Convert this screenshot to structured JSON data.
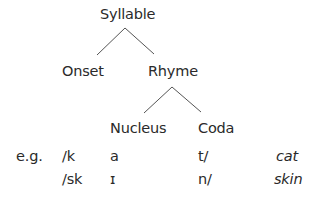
{
  "diagram": {
    "root": "Syllable",
    "level1": [
      "Onset",
      "Rhyme"
    ],
    "level2": [
      "Nucleus",
      "Coda"
    ],
    "edges": [
      {
        "from": "Syllable",
        "to": "Onset"
      },
      {
        "from": "Syllable",
        "to": "Rhyme"
      },
      {
        "from": "Rhyme",
        "to": "Nucleus"
      },
      {
        "from": "Rhyme",
        "to": "Coda"
      }
    ],
    "line_color": "#555555"
  },
  "examples": {
    "prefix": "e.g.",
    "rows": [
      {
        "onset": "/k",
        "nucleus": "a",
        "coda": "t/",
        "word": "cat"
      },
      {
        "onset": "/sk",
        "nucleus": "ɪ",
        "coda": "n/",
        "word": "skin"
      }
    ]
  }
}
